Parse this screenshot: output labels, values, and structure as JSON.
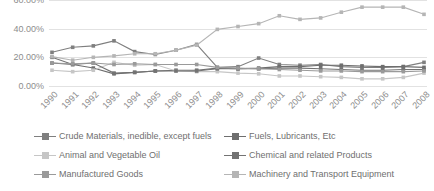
{
  "chart_data": {
    "type": "line",
    "title": "",
    "subtitle": "",
    "xlabel": "",
    "ylabel": "",
    "grid": true,
    "legend_position": "bottom",
    "ylim": [
      0,
      60
    ],
    "y_ticks": [
      "0.00%",
      "20.00%",
      "40.00%",
      "60.00%"
    ],
    "y_tick_values": [
      0,
      20,
      40,
      60
    ],
    "categories": [
      "1990",
      "1991",
      "1992",
      "1993",
      "1994",
      "1995",
      "1996",
      "1997",
      "1998",
      "1999",
      "2000",
      "2001",
      "2002",
      "2003",
      "2004",
      "2005",
      "2006",
      "2007",
      "2008"
    ],
    "series": [
      {
        "name": "Crude Materials, inedible, except fuels",
        "color": "#7f7f7f",
        "values": [
          23.5,
          27.0,
          28.0,
          31.5,
          24.0,
          22.0,
          25.0,
          29.0,
          13.0,
          13.5,
          19.5,
          15.0,
          14.5,
          15.0,
          13.5,
          13.0,
          13.0,
          13.5,
          16.5
        ]
      },
      {
        "name": "Fuels, Lubricants, Etc",
        "color": "#6e6e6e",
        "values": [
          16.0,
          15.0,
          12.5,
          8.5,
          9.5,
          10.5,
          11.0,
          11.0,
          12.5,
          12.0,
          12.5,
          13.5,
          13.5,
          14.5,
          14.5,
          14.0,
          13.5,
          13.5,
          13.0
        ]
      },
      {
        "name": "Animal and Vegetable Oil",
        "color": "#c6c6c6",
        "values": [
          11.0,
          10.0,
          11.0,
          16.5,
          14.5,
          15.0,
          10.5,
          10.0,
          10.0,
          9.0,
          8.5,
          7.0,
          7.0,
          6.5,
          6.0,
          5.0,
          5.0,
          6.0,
          9.0
        ]
      },
      {
        "name": "Chemical and related Products",
        "color": "#737373",
        "values": [
          20.0,
          15.0,
          16.0,
          9.0,
          9.5,
          10.5,
          10.5,
          10.5,
          12.0,
          12.0,
          12.0,
          12.5,
          12.5,
          12.0,
          11.5,
          11.0,
          11.0,
          11.5,
          11.5
        ]
      },
      {
        "name": "Manufactured Goods",
        "color": "#9a9a9a",
        "values": [
          16.0,
          15.5,
          16.0,
          15.0,
          15.5,
          15.0,
          15.0,
          15.0,
          13.0,
          12.5,
          12.0,
          11.5,
          11.0,
          10.5,
          10.5,
          10.0,
          10.0,
          10.0,
          10.5
        ]
      },
      {
        "name": "Machinery and Transport Equipment",
        "color": "#b5b5b5",
        "values": [
          20.5,
          18.0,
          20.0,
          21.0,
          22.5,
          22.5,
          25.0,
          28.5,
          39.5,
          41.5,
          43.5,
          49.0,
          46.5,
          47.5,
          51.5,
          55.0,
          55.0,
          55.0,
          50.0
        ]
      }
    ]
  }
}
